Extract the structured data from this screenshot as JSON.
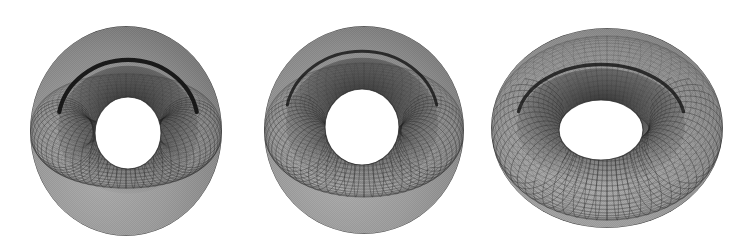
{
  "figure": {
    "background_color": "#ffffff",
    "width": 735,
    "height": 251,
    "panel_count": 3,
    "render_style": "shaded mesh / wireframe surface with hidden-line removal",
    "mesh_color_dark": "#1a1a1a",
    "mesh_color_mid": "#8c8c8c",
    "mesh_color_light": "#c9c9c9",
    "mesh_color_shadow": "#2b2b2b",
    "surface_fill": "#909090"
  },
  "chart_data": {
    "type": "scatter",
    "subtitle": "Same torus surface drawn at three camera elevation angles",
    "xlabel": "",
    "ylabel": "",
    "grid": false,
    "legend_position": "none",
    "categories": [
      "Panel 1",
      "Panel 2",
      "Panel 3"
    ],
    "series": [
      {
        "name": "camera_elevation_deg",
        "values": [
          32,
          42,
          58
        ]
      },
      {
        "name": "outer_radius_px",
        "values": [
          96,
          100,
          116
        ]
      },
      {
        "name": "hole_radius_px",
        "values": [
          33,
          37,
          42
        ]
      },
      {
        "name": "mesh_meridian_count",
        "values": [
          64,
          64,
          64
        ]
      },
      {
        "name": "mesh_parallel_count",
        "values": [
          48,
          48,
          48
        ]
      }
    ],
    "annotations": [
      "Left torus: steepest tilt, deep dark crescent between far rim and inner bulge",
      "Middle torus: intermediate tilt, near-circular central hole",
      "Right torus: flattest / most top-down, elliptical central hole and visible inner tube wall"
    ]
  },
  "panels": [
    {
      "id": "torus-left",
      "label": "Torus A",
      "center_x": 126,
      "center_y": 131,
      "outer_rx": 96,
      "outer_ry": 105,
      "hole_cx": 128,
      "hole_cy": 133,
      "hole_rx": 33,
      "hole_ry": 36,
      "tilt": 0.4,
      "inner_ring_rx": 70,
      "inner_ring_ry": 64,
      "meridians": 64,
      "parallels": 44
    },
    {
      "id": "torus-middle",
      "label": "Torus B",
      "center_x": 364,
      "center_y": 130,
      "outer_rx": 100,
      "outer_ry": 104,
      "hole_cx": 362,
      "hole_cy": 127,
      "hole_rx": 37,
      "hole_ry": 38,
      "tilt": 0.52,
      "inner_ring_rx": 76,
      "inner_ring_ry": 66,
      "meridians": 64,
      "parallels": 44
    },
    {
      "id": "torus-right",
      "label": "Torus C",
      "center_x": 607,
      "center_y": 128,
      "outer_rx": 116,
      "outer_ry": 100,
      "hole_cx": 601,
      "hole_cy": 130,
      "hole_rx": 42,
      "hole_ry": 30,
      "tilt": 0.7,
      "inner_ring_rx": 84,
      "inner_ring_ry": 58,
      "meridians": 64,
      "parallels": 44
    }
  ]
}
